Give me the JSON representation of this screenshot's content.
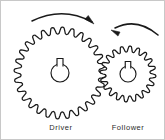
{
  "figure": {
    "background_color": "#ffffff",
    "line_color": "#1a1a1a",
    "border_color": "#c8c8c8",
    "width": 165,
    "height": 140
  },
  "gears": [
    {
      "id": "driver",
      "label": "Driver",
      "role": "driver",
      "center_x": 59,
      "center_y": 72,
      "outer_radius": 46,
      "root_radius": 39,
      "tooth_count": 28,
      "bore_radius": 9,
      "keyway_width": 6,
      "keyway_height": 8,
      "label_x": 60,
      "label_y": 129,
      "rotation_direction": "clockwise"
    },
    {
      "id": "follower",
      "label": "Follower",
      "role": "follower",
      "center_x": 127,
      "center_y": 73,
      "outer_radius": 28,
      "root_radius": 22,
      "tooth_count": 20,
      "bore_radius": 8,
      "keyway_width": 5.5,
      "keyway_height": 7,
      "label_x": 127,
      "label_y": 129,
      "rotation_direction": "counter-clockwise"
    }
  ],
  "arrows": [
    {
      "id": "driver-rotation-arrow",
      "describes": "driver",
      "direction": "clockwise",
      "path": "M 31,20 Q 62,5 91,21",
      "head_x": 93,
      "head_y": 23,
      "head_angle": 42,
      "head_length": 10,
      "head_width": 5
    },
    {
      "id": "follower-rotation-arrow",
      "describes": "follower",
      "direction": "counter-clockwise",
      "path": "M 157,34 Q 136,16 114,27",
      "head_x": 110,
      "head_y": 29,
      "head_angle": 207,
      "head_length": 9,
      "head_width": 4.5
    }
  ]
}
